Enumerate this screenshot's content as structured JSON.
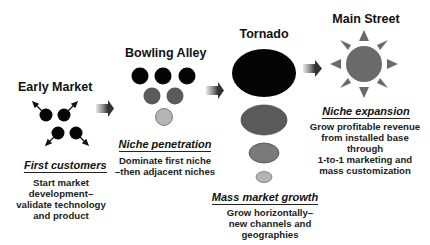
{
  "stages": [
    {
      "id": "early-market",
      "title": "Early Market",
      "subtitle": "First customers",
      "description": [
        "Start market",
        "development–",
        "validate technology",
        "and product"
      ]
    },
    {
      "id": "bowling-alley",
      "title": "Bowling Alley",
      "subtitle": "Niche penetration",
      "description": [
        "Dominate first niche",
        "–then adjacent niches"
      ]
    },
    {
      "id": "tornado",
      "title": "Tornado",
      "subtitle": "Mass market growth",
      "description": [
        "Grow horizontally–",
        "new channels and geographies"
      ]
    },
    {
      "id": "main-street",
      "title": "Main Street",
      "subtitle": "Niche expansion",
      "description": [
        "Grow profitable revenue",
        "from installed base",
        "through",
        "1-to-1 marketing and",
        "mass customization"
      ]
    }
  ],
  "colors": {
    "black": "#050505",
    "dark_gray": "#5a5a5a",
    "mid_gray": "#7a7a7a",
    "light_gray": "#b5b5b5",
    "sun": "#6a6a6a"
  }
}
